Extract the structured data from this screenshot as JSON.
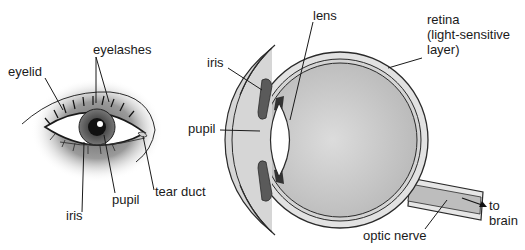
{
  "external_eye": {
    "labels": {
      "eyelid": "eyelid",
      "eyelashes": "eyelashes",
      "iris": "iris",
      "pupil": "pupil",
      "tear_duct": "tear duct"
    }
  },
  "cross_section": {
    "labels": {
      "lens": "lens",
      "iris": "iris",
      "pupil": "pupil",
      "retina_line1": "retina",
      "retina_line2": "(light-sensitive",
      "retina_line3": "layer)",
      "optic_nerve": "optic nerve",
      "to_brain_line1": "to",
      "to_brain_line2": "brain"
    }
  },
  "colors": {
    "line": "#2a2a2a",
    "shade_dark": "#5a5a5a",
    "shade_mid": "#bdbdbd",
    "shade_light": "#e2e2e2"
  }
}
